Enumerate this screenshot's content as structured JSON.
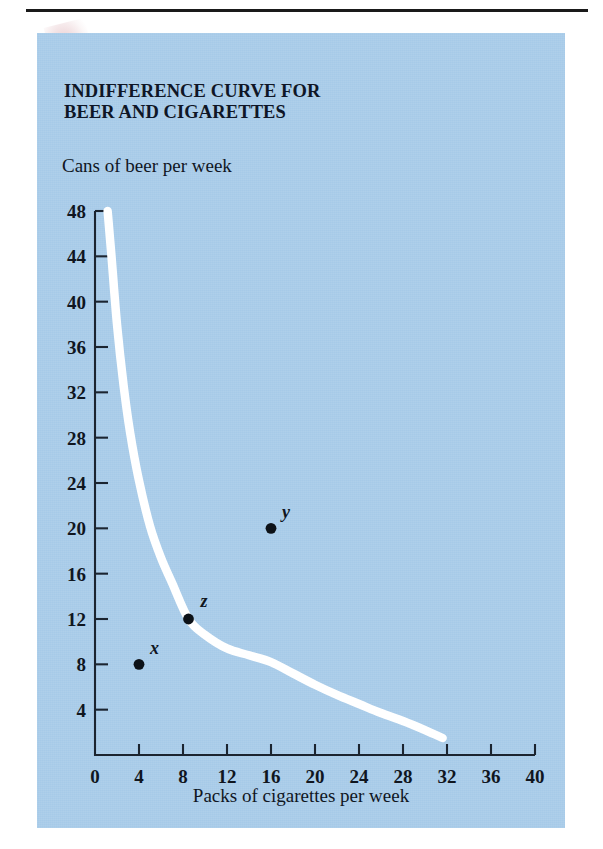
{
  "figure": {
    "title": "INDIFFERENCE CURVE FOR\nBEER AND CIGARETTES",
    "panel_color": "#a6cae8",
    "curve_color": "#ffffff",
    "ink_color": "#10161f"
  },
  "chart_data": {
    "type": "line",
    "title": "INDIFFERENCE CURVE FOR BEER AND CIGARETTES",
    "xlabel": "Packs of cigarettes per week",
    "ylabel": "Cans of beer per week",
    "xlim": [
      0,
      40
    ],
    "ylim": [
      0,
      48
    ],
    "grid": false,
    "legend": "none",
    "xticks": [
      0,
      4,
      8,
      12,
      16,
      20,
      24,
      28,
      32,
      36,
      40
    ],
    "yticks": [
      0,
      4,
      8,
      12,
      16,
      20,
      24,
      28,
      32,
      36,
      40,
      44,
      48
    ],
    "xtick_labels": [
      "0",
      "4",
      "8",
      "12",
      "16",
      "20",
      "24",
      "28",
      "32",
      "36",
      "40"
    ],
    "ytick_labels": [
      "0",
      "4",
      "8",
      "12",
      "16",
      "20",
      "24",
      "28",
      "32",
      "36",
      "40",
      "44",
      "48"
    ],
    "series": [
      {
        "name": "indifference curve",
        "type": "line",
        "color": "#ffffff",
        "x": [
          1.15,
          1.5,
          2.0,
          2.6,
          3.2,
          4.0,
          5.0,
          6.0,
          7.0,
          8.5,
          10.0,
          12.0,
          14.0,
          16.0,
          18.0,
          20.0,
          22.0,
          24.0,
          26.0,
          28.0,
          30.0,
          31.6
        ],
        "y": [
          48.0,
          44.0,
          38.0,
          32.6,
          28.4,
          24.2,
          20.2,
          17.4,
          15.2,
          12.0,
          10.6,
          9.4,
          8.8,
          8.2,
          7.2,
          6.2,
          5.3,
          4.5,
          3.7,
          3.0,
          2.2,
          1.5
        ]
      }
    ],
    "points": [
      {
        "label": "x",
        "x": 4,
        "y": 8,
        "on_curve": false,
        "label_dx": 11,
        "label_dy": -10
      },
      {
        "label": "y",
        "x": 16,
        "y": 20,
        "on_curve": false,
        "label_dx": 11,
        "label_dy": -10
      },
      {
        "label": "z",
        "x": 8.5,
        "y": 12,
        "on_curve": true,
        "label_dx": 12,
        "label_dy": -12
      }
    ]
  },
  "annotations": {
    "point_x_label": "x",
    "point_y_label": "y",
    "point_z_label": "z"
  }
}
